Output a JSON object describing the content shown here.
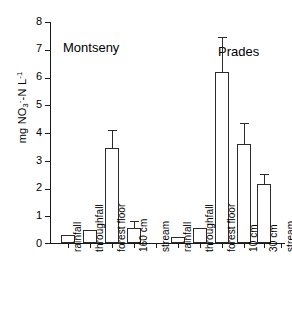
{
  "chart_data": {
    "type": "bar",
    "title": "",
    "xlabel": "",
    "ylabel": "mg NO3--N L-1",
    "ylabel_parts": {
      "prefix": "mg NO",
      "sub": "3",
      "sup_minus": "-",
      "mid": "-N L",
      "sup_exp": "-1"
    },
    "ylim": [
      0,
      8
    ],
    "yticks": [
      0,
      1,
      2,
      3,
      4,
      5,
      6,
      7,
      8
    ],
    "grid": false,
    "legend": "none",
    "bar_color": "#ffffff",
    "bar_edge_color": "#2b2b2b",
    "axis_color": "#1a1a1a",
    "error_bars": "upper-only (standard error)",
    "groups": [
      {
        "name": "Montseny",
        "categories": [
          "rainfall",
          "throughfall",
          "forest floor",
          "160 cm",
          "stream"
        ],
        "values": [
          0.28,
          0.48,
          3.45,
          0.55,
          0.02
        ],
        "errors": [
          0.0,
          0.0,
          0.65,
          0.25,
          0.0
        ]
      },
      {
        "name": "Prades",
        "categories": [
          "rainfall",
          "throughfall",
          "forest floor",
          "10 cm",
          "30 cm",
          "stream"
        ],
        "values": [
          0.22,
          0.55,
          6.2,
          3.57,
          2.12,
          0.02
        ],
        "errors": [
          0.0,
          0.0,
          1.25,
          0.78,
          0.38,
          0.0
        ]
      }
    ]
  },
  "axis": {
    "y_tick_labels": [
      "8",
      "7",
      "6",
      "5",
      "4",
      "3",
      "2",
      "1",
      "0"
    ]
  }
}
